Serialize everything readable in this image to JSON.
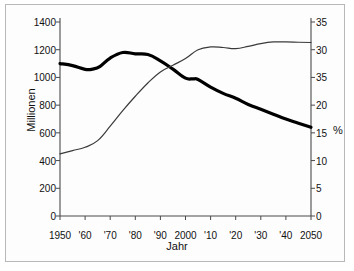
{
  "chart_data": {
    "type": "line",
    "title": "",
    "xlabel": "Jahr",
    "ylabel": "Millionen",
    "ylabel_right": "%",
    "xlim": [
      1950,
      2050
    ],
    "ylim": [
      0,
      1400
    ],
    "ylim_right": [
      0,
      35
    ],
    "grid": false,
    "legend": "none",
    "x_tick_labels": [
      "1950",
      "'60",
      "'70",
      "'80",
      "'90",
      "2000",
      "'10",
      "'20",
      "'30",
      "'40",
      "2050"
    ],
    "x_tick_values": [
      1950,
      1960,
      1970,
      1980,
      1990,
      2000,
      2010,
      2020,
      2030,
      2040,
      2050
    ],
    "y_tick_labels_left": [
      "0",
      "200",
      "400",
      "600",
      "800",
      "1000",
      "1200",
      "1400"
    ],
    "y_tick_values_left": [
      0,
      200,
      400,
      600,
      800,
      1000,
      1200,
      1400
    ],
    "y_tick_labels_right": [
      "0",
      "5",
      "10",
      "15",
      "20",
      "35",
      "30",
      "35"
    ],
    "y_tick_values_right": [
      0,
      5,
      10,
      15,
      20,
      25,
      30,
      35
    ],
    "series": [
      {
        "name": "Millionen",
        "axis": "left",
        "style": "thick",
        "color": "#000000",
        "x": [
          1950,
          1955,
          1960,
          1963,
          1966,
          1970,
          1975,
          1980,
          1985,
          1990,
          1995,
          2000,
          2003,
          2005,
          2010,
          2015,
          2020,
          2025,
          2030,
          2035,
          2040,
          2045,
          2050
        ],
        "values": [
          1100,
          1085,
          1058,
          1060,
          1080,
          1140,
          1180,
          1170,
          1165,
          1120,
          1060,
          995,
          990,
          985,
          930,
          885,
          850,
          805,
          770,
          735,
          700,
          670,
          640
        ]
      },
      {
        "name": "%",
        "axis": "right",
        "style": "thin",
        "color": "#3a3a3a",
        "x": [
          1950,
          1955,
          1960,
          1965,
          1970,
          1975,
          1980,
          1985,
          1990,
          1995,
          2000,
          2005,
          2010,
          2015,
          2020,
          2025,
          2030,
          2035,
          2040,
          2045,
          2050
        ],
        "values": [
          11.2,
          11.8,
          12.4,
          13.6,
          16.2,
          19.0,
          21.6,
          24.0,
          26.0,
          27.2,
          28.4,
          30.0,
          30.5,
          30.4,
          30.2,
          30.6,
          31.1,
          31.4,
          31.4,
          31.35,
          31.3
        ]
      }
    ]
  }
}
